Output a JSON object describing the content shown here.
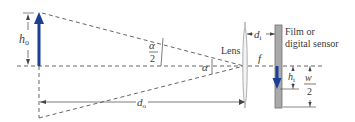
{
  "diagram": {
    "type": "camera lens image formation geometry",
    "labels": {
      "object_height": "h",
      "object_height_sub": "o",
      "object_distance": "d",
      "object_distance_sub": "o",
      "image_distance": "d",
      "image_distance_sub": "i",
      "image_height": "h",
      "image_height_sub": "i",
      "half_angle_num": "α",
      "half_angle_den": "2",
      "angle": "α",
      "lens": "Lens",
      "focal_length": "f",
      "sensor_line1": "Film or",
      "sensor_line2": "digital sensor",
      "half_width_num": "w",
      "half_width_den": "2"
    },
    "colors": {
      "arrow": "#1c3e94",
      "lines": "#555555",
      "sensor_fill": "#a9a9a9",
      "sensor_stroke": "#6e6e6e",
      "lens_stroke": "#9a9a9a"
    }
  }
}
